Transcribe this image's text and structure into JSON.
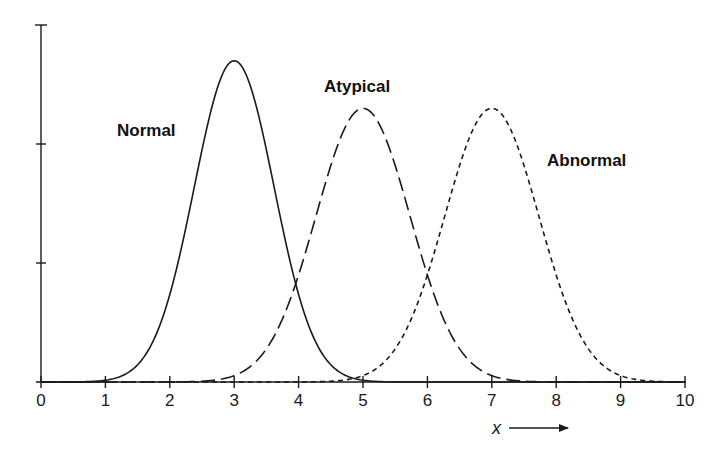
{
  "chart_data": {
    "type": "line",
    "title": "",
    "xlabel": "x",
    "ylabel": "",
    "xlim": [
      0,
      10
    ],
    "ylim": [
      0,
      3
    ],
    "x_ticks": [
      "0",
      "1",
      "2",
      "3",
      "4",
      "5",
      "6",
      "7",
      "8",
      "9",
      "10"
    ],
    "y_ticks_count": 3,
    "y_tick_labels": [],
    "grid": false,
    "legend": "none (curves labeled directly)",
    "series": [
      {
        "name": "Normal",
        "style": "solid",
        "distribution": "gaussian",
        "mean": 3,
        "sigma": 0.62,
        "peak": 2.7,
        "label_pos": [
          1.18,
          2.08
        ]
      },
      {
        "name": "Atypical",
        "style": "long-dash",
        "distribution": "gaussian",
        "mean": 5,
        "sigma": 0.73,
        "peak": 2.3,
        "label_pos": [
          4.4,
          2.45
        ]
      },
      {
        "name": "Abnormal",
        "style": "short-dash",
        "distribution": "gaussian",
        "mean": 7,
        "sigma": 0.73,
        "peak": 2.3,
        "label_pos": [
          7.85,
          1.83
        ]
      }
    ],
    "annotations": [
      {
        "text": "x",
        "arrow": "right",
        "position": "below x-axis, under 7–8"
      }
    ]
  },
  "labels": {
    "normal": "Normal",
    "atypical": "Atypical",
    "abnormal": "Abnormal",
    "x_axis_var": "x"
  },
  "x_tick_labels": {
    "t0": "0",
    "t1": "1",
    "t2": "2",
    "t3": "3",
    "t4": "4",
    "t5": "5",
    "t6": "6",
    "t7": "7",
    "t8": "8",
    "t9": "9",
    "t10": "10"
  }
}
